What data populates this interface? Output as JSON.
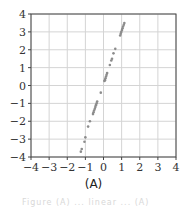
{
  "chart_data": {
    "type": "scatter",
    "title": "",
    "xlabel": "",
    "ylabel": "",
    "xlim": [
      -4,
      4
    ],
    "ylim": [
      -4,
      4
    ],
    "grid": true,
    "legend": null,
    "x_ticks": [
      -4,
      -3,
      -2,
      -1,
      0,
      1,
      2,
      3,
      4
    ],
    "y_ticks": [
      -4,
      -3,
      -2,
      -1,
      0,
      1,
      2,
      3,
      4
    ],
    "x_tick_labels": [
      "−4",
      "−3",
      "−2",
      "−1",
      "0",
      "1",
      "2",
      "3",
      "4"
    ],
    "y_tick_labels": [
      "−4",
      "−3",
      "−2",
      "−1",
      "0",
      "1",
      "2",
      "3",
      "4"
    ],
    "series": [
      {
        "name": "points",
        "color": "#8c8c8c",
        "points": [
          [
            1.15,
            3.5
          ],
          [
            1.12,
            3.4
          ],
          [
            1.08,
            3.3
          ],
          [
            1.05,
            3.2
          ],
          [
            1.02,
            3.1
          ],
          [
            0.98,
            3.0
          ],
          [
            0.95,
            2.9
          ],
          [
            0.92,
            2.8
          ],
          [
            0.65,
            2.05
          ],
          [
            0.55,
            1.8
          ],
          [
            0.47,
            1.5
          ],
          [
            0.43,
            1.4
          ],
          [
            0.35,
            1.15
          ],
          [
            0.2,
            0.7
          ],
          [
            0.17,
            0.6
          ],
          [
            0.14,
            0.5
          ],
          [
            0.11,
            0.4
          ],
          [
            0.08,
            0.3
          ],
          [
            0.05,
            0.25
          ],
          [
            -0.15,
            -0.4
          ],
          [
            -0.35,
            -0.9
          ],
          [
            -0.38,
            -1.0
          ],
          [
            -0.42,
            -1.1
          ],
          [
            -0.45,
            -1.2
          ],
          [
            -0.48,
            -1.3
          ],
          [
            -0.52,
            -1.4
          ],
          [
            -0.55,
            -1.5
          ],
          [
            -0.58,
            -1.6
          ],
          [
            -0.75,
            -2.0
          ],
          [
            -0.85,
            -2.3
          ],
          [
            -1.0,
            -2.9
          ],
          [
            -1.05,
            -3.15
          ],
          [
            -1.2,
            -3.55
          ],
          [
            -1.25,
            -3.7
          ]
        ]
      }
    ]
  },
  "caption": "(A)",
  "footer_text": "Figure (A) ... linear ... (A)"
}
